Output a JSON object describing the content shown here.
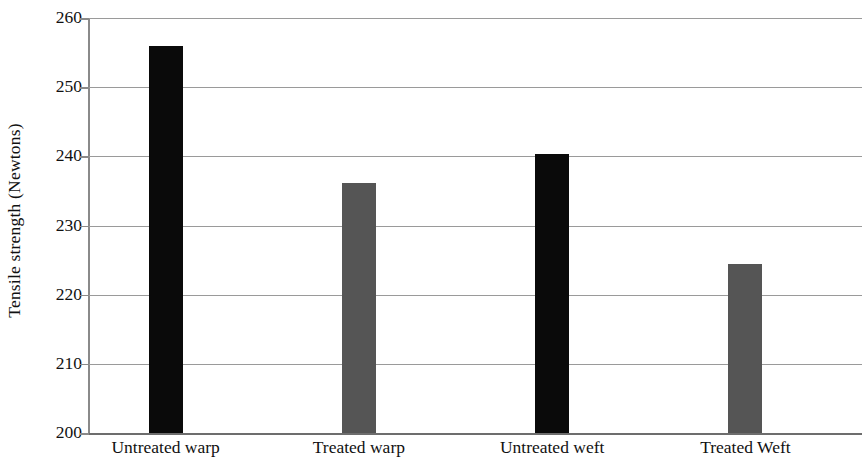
{
  "chart_data": {
    "type": "bar",
    "title": "",
    "subtitle": "",
    "xlabel": "",
    "ylabel": "Tensile strength (Newtons)",
    "categories": [
      "Untreated warp",
      "Treated warp",
      "Untreated weft",
      "Treated Weft"
    ],
    "values": [
      256.0,
      236.2,
      240.3,
      224.5
    ],
    "bar_colors": [
      "#0a0a0a",
      "#555555",
      "#0a0a0a",
      "#555555"
    ],
    "ylim": [
      200,
      260
    ],
    "yticks": [
      200,
      210,
      220,
      230,
      240,
      250,
      260
    ],
    "ytick_labels": [
      "200",
      "210",
      "220",
      "230",
      "240",
      "250",
      "260"
    ],
    "grid": true,
    "grid_axis": "y",
    "legend": false,
    "legend_position": "none",
    "grid_color": "#9a9a9a",
    "axis_color": "#8a8a8a",
    "background_color": "#ffffff"
  }
}
